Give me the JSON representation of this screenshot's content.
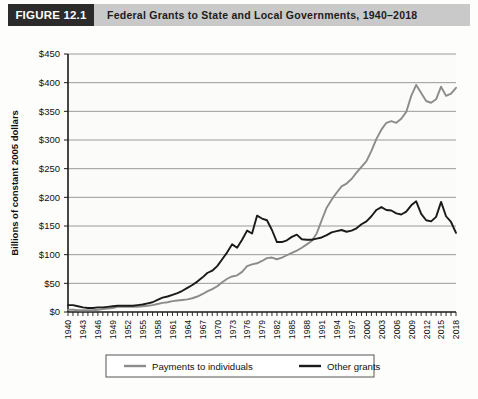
{
  "header": {
    "badge": "FIGURE 12.1",
    "title": "Federal Grants to State and Local Governments, 1940–2018",
    "badge_bg": "#2b2b2b",
    "bar_bg": "#c9c9c9"
  },
  "colors": {
    "payments_to_individuals": "#8c8c8c",
    "other_grants": "#1a1a1a",
    "grid": "#8f8f8f",
    "axis": "#1a1a1a",
    "plot_bg": "#fbfbf9"
  },
  "chart_data": {
    "type": "line",
    "title": "Federal Grants to State and Local Governments, 1940–2018",
    "xlabel": "",
    "ylabel": "Billions of constant 2005 dollars",
    "ylim": [
      0,
      450
    ],
    "ytick_values": [
      0,
      50,
      100,
      150,
      200,
      250,
      300,
      350,
      400,
      450
    ],
    "ytick_labels": [
      "$0",
      "$50",
      "$100",
      "$150",
      "$200",
      "$250",
      "$300",
      "$350",
      "$400",
      "$450"
    ],
    "xlim": [
      1940,
      2018
    ],
    "xtick_labels": [
      "1940",
      "1943",
      "1946",
      "1949",
      "1952",
      "1955",
      "1958",
      "1961",
      "1964",
      "1967",
      "1970",
      "1973",
      "1976",
      "1979",
      "1982",
      "1985",
      "1988",
      "1991",
      "1994",
      "1997",
      "2000",
      "2003",
      "2006",
      "2009",
      "2012",
      "2015",
      "2018"
    ],
    "grid": true,
    "legend_position": "bottom",
    "x": [
      1940,
      1941,
      1942,
      1943,
      1944,
      1945,
      1946,
      1947,
      1948,
      1949,
      1950,
      1951,
      1952,
      1953,
      1954,
      1955,
      1956,
      1957,
      1958,
      1959,
      1960,
      1961,
      1962,
      1963,
      1964,
      1965,
      1966,
      1967,
      1968,
      1969,
      1970,
      1971,
      1972,
      1973,
      1974,
      1975,
      1976,
      1977,
      1978,
      1979,
      1980,
      1981,
      1982,
      1983,
      1984,
      1985,
      1986,
      1987,
      1988,
      1989,
      1990,
      1991,
      1992,
      1993,
      1994,
      1995,
      1996,
      1997,
      1998,
      1999,
      2000,
      2001,
      2002,
      2003,
      2004,
      2005,
      2006,
      2007,
      2008,
      2009,
      2010,
      2011,
      2012,
      2013,
      2014,
      2015,
      2016,
      2017,
      2018
    ],
    "series": [
      {
        "name": "Payments to individuals",
        "color": "#8c8c8c",
        "values": [
          4,
          4,
          3,
          3,
          3,
          3,
          4,
          5,
          6,
          7,
          9,
          9,
          9,
          9,
          9,
          10,
          11,
          12,
          14,
          16,
          17,
          19,
          20,
          21,
          22,
          24,
          27,
          31,
          36,
          40,
          45,
          52,
          58,
          62,
          64,
          70,
          80,
          83,
          85,
          89,
          94,
          95,
          92,
          95,
          99,
          103,
          107,
          112,
          118,
          124,
          137,
          160,
          182,
          196,
          208,
          219,
          224,
          232,
          243,
          253,
          263,
          281,
          302,
          318,
          330,
          333,
          330,
          337,
          349,
          377,
          396,
          382,
          368,
          365,
          371,
          393,
          377,
          381,
          391
        ]
      },
      {
        "name": "Other grants",
        "color": "#1a1a1a",
        "values": [
          12,
          12,
          10,
          8,
          7,
          7,
          8,
          8,
          9,
          10,
          11,
          11,
          11,
          11,
          12,
          13,
          15,
          17,
          21,
          25,
          27,
          30,
          33,
          37,
          42,
          47,
          53,
          60,
          68,
          72,
          80,
          92,
          104,
          118,
          112,
          126,
          142,
          137,
          168,
          163,
          160,
          143,
          122,
          122,
          125,
          131,
          135,
          127,
          126,
          126,
          128,
          130,
          134,
          139,
          141,
          143,
          140,
          142,
          146,
          153,
          158,
          167,
          178,
          183,
          178,
          177,
          172,
          170,
          175,
          186,
          193,
          171,
          160,
          158,
          166,
          192,
          167,
          157,
          138
        ]
      }
    ],
    "legend": [
      {
        "label": "Payments to individuals",
        "color": "#8c8c8c"
      },
      {
        "label": "Other grants",
        "color": "#1a1a1a"
      }
    ]
  }
}
